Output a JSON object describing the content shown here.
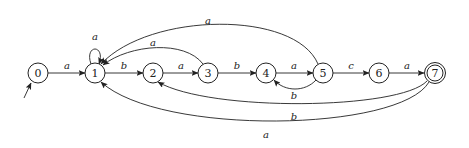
{
  "diagram": {
    "type": "finite-automaton",
    "initial_state": "0",
    "accepting_states": [
      "7"
    ],
    "states": [
      {
        "id": "0",
        "label": "0",
        "x": 38,
        "y": 73
      },
      {
        "id": "1",
        "label": "1",
        "x": 95,
        "y": 73
      },
      {
        "id": "2",
        "label": "2",
        "x": 153,
        "y": 73
      },
      {
        "id": "3",
        "label": "3",
        "x": 208,
        "y": 73
      },
      {
        "id": "4",
        "label": "4",
        "x": 266,
        "y": 73
      },
      {
        "id": "5",
        "label": "5",
        "x": 323,
        "y": 73
      },
      {
        "id": "6",
        "label": "6",
        "x": 379,
        "y": 73
      },
      {
        "id": "7",
        "label": "7",
        "x": 435,
        "y": 73
      }
    ],
    "transitions": [
      {
        "from": "0",
        "to": "1",
        "label": "a"
      },
      {
        "from": "1",
        "to": "1",
        "label": "a"
      },
      {
        "from": "1",
        "to": "2",
        "label": "b"
      },
      {
        "from": "2",
        "to": "3",
        "label": "a"
      },
      {
        "from": "3",
        "to": "1",
        "label": "a"
      },
      {
        "from": "3",
        "to": "4",
        "label": "b"
      },
      {
        "from": "4",
        "to": "5",
        "label": "a"
      },
      {
        "from": "5",
        "to": "4",
        "label": "b"
      },
      {
        "from": "5",
        "to": "1",
        "label": "a"
      },
      {
        "from": "5",
        "to": "6",
        "label": "c"
      },
      {
        "from": "6",
        "to": "7",
        "label": "a"
      },
      {
        "from": "7",
        "to": "2",
        "label": "b"
      },
      {
        "from": "7",
        "to": "1",
        "label": "a"
      }
    ]
  }
}
